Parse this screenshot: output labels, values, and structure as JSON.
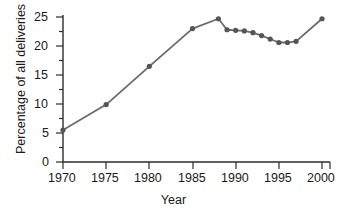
{
  "chart_data": {
    "type": "line",
    "title": "",
    "subtitle": "",
    "xlabel": "Year",
    "ylabel": "Percentage of all deliveries",
    "xlim": [
      1969,
      2001
    ],
    "ylim": [
      0,
      26
    ],
    "xticks": [
      1970,
      1975,
      1980,
      1985,
      1990,
      1995,
      2000
    ],
    "xtick_labels": [
      "1970",
      "1975",
      "1980",
      "1985",
      "1990",
      "1995",
      "2000"
    ],
    "yticks": [
      0,
      5,
      10,
      15,
      20,
      25
    ],
    "ytick_labels": [
      "0",
      "5",
      "10",
      "15",
      "20",
      "25"
    ],
    "yminor_ticks": [
      2.5,
      7.5,
      12.5,
      17.5,
      22.5
    ],
    "grid": false,
    "legend": null,
    "legend_position": "none",
    "marker": "circle",
    "series": [
      {
        "name": "Percentage of all deliveries",
        "color": "#6b6b6b",
        "x": [
          1970,
          1975,
          1980,
          1985,
          1988,
          1989,
          1990,
          1991,
          1992,
          1993,
          1994,
          1995,
          1996,
          1997,
          2000
        ],
        "values": [
          5.5,
          9.9,
          16.5,
          23.0,
          24.7,
          22.8,
          22.7,
          22.6,
          22.3,
          21.8,
          21.2,
          20.6,
          20.6,
          20.8,
          24.7
        ]
      }
    ],
    "annotations": []
  },
  "axis": {
    "y_axis_name": "y-axis",
    "x_axis_name": "x-axis"
  }
}
